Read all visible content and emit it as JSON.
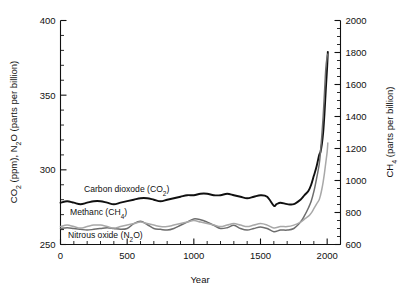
{
  "chart_data": {
    "type": "line",
    "title": "",
    "xlabel": "Year",
    "ylabel_left": "CO2 (ppm), N2O (parts per billion)",
    "ylabel_right": "CH4 (parts per billion)",
    "xlim": [
      0,
      2100
    ],
    "ylim_left": [
      250,
      400
    ],
    "ylim_right": [
      600,
      2000
    ],
    "grid": false,
    "legend_position": "inline-annotations",
    "xticks": [
      0,
      500,
      1000,
      1500,
      2000
    ],
    "xticklabels": [
      "0",
      "500",
      "1000",
      "1500",
      "2000"
    ],
    "x_minor_step": 100,
    "yticks_left": [
      250,
      300,
      350,
      400
    ],
    "yticklabels_left": [
      "250",
      "300",
      "350",
      "400"
    ],
    "y_left_minor_step": 10,
    "yticks_right": [
      600,
      800,
      1000,
      1200,
      1400,
      1600,
      1800,
      2000
    ],
    "yticklabels_right": [
      "600",
      "800",
      "1000",
      "1200",
      "1400",
      "1600",
      "1800",
      "2000"
    ],
    "y_right_minor_step": 50,
    "series": [
      {
        "name": "Carbon dioxode (CO2)",
        "label": "Carbon dioxode (CO₂)",
        "axis": "left",
        "units": "ppm",
        "color": "#101010",
        "stroke_width": 1.9,
        "label_x": 300,
        "label_y": 292,
        "x": [
          0,
          50,
          100,
          150,
          200,
          250,
          300,
          350,
          400,
          450,
          500,
          550,
          600,
          650,
          700,
          750,
          800,
          850,
          900,
          950,
          1000,
          1050,
          1100,
          1150,
          1200,
          1250,
          1300,
          1350,
          1400,
          1450,
          1500,
          1550,
          1600,
          1620,
          1650,
          1700,
          1750,
          1800,
          1830,
          1860,
          1880,
          1900,
          1920,
          1940,
          1950,
          1960,
          1970,
          1980,
          1990,
          2000,
          2005
        ],
        "y": [
          278,
          279,
          278,
          277,
          278,
          279,
          279,
          278,
          277,
          278,
          279,
          280,
          281,
          281,
          280,
          279,
          280,
          281,
          282,
          283,
          283,
          284,
          284,
          283,
          283,
          284,
          283,
          282,
          281,
          282,
          283,
          282,
          276,
          277,
          278,
          277,
          277,
          280,
          283,
          286,
          290,
          296,
          302,
          310,
          312,
          317,
          325,
          338,
          354,
          369,
          379
        ]
      },
      {
        "name": "Methanc (CH4)",
        "label": "Methanc (CH₄)",
        "axis": "right",
        "units": "ppb",
        "color": "#6d6d6d",
        "stroke_width": 1.5,
        "label_x": 240,
        "label_y": 1000,
        "x": [
          0,
          50,
          100,
          150,
          200,
          250,
          300,
          350,
          400,
          450,
          500,
          550,
          600,
          650,
          700,
          750,
          800,
          850,
          900,
          950,
          1000,
          1050,
          1100,
          1150,
          1200,
          1250,
          1300,
          1350,
          1400,
          1450,
          1500,
          1550,
          1600,
          1650,
          1700,
          1750,
          1800,
          1830,
          1860,
          1880,
          1900,
          1920,
          1940,
          1950,
          1960,
          1970,
          1980,
          1990,
          2000,
          2005
        ],
        "y": [
          700,
          705,
          700,
          695,
          690,
          695,
          700,
          705,
          700,
          695,
          700,
          730,
          745,
          725,
          700,
          695,
          690,
          700,
          720,
          740,
          760,
          755,
          740,
          720,
          700,
          705,
          720,
          700,
          690,
          700,
          710,
          700,
          680,
          690,
          690,
          700,
          740,
          780,
          830,
          870,
          930,
          1010,
          1100,
          1180,
          1280,
          1400,
          1550,
          1700,
          1775,
          1790
        ]
      },
      {
        "name": "Nitrous oxide (N2O)",
        "label": "Nitrous oxide (N₂O)",
        "axis": "left",
        "units": "ppb",
        "color": "#a8a8a8",
        "stroke_width": 1.5,
        "label_x": 300,
        "label_y": 258,
        "x": [
          0,
          50,
          100,
          150,
          200,
          250,
          300,
          350,
          400,
          450,
          500,
          550,
          600,
          650,
          700,
          750,
          800,
          850,
          900,
          950,
          1000,
          1050,
          1100,
          1150,
          1200,
          1250,
          1300,
          1350,
          1400,
          1450,
          1500,
          1550,
          1600,
          1650,
          1700,
          1750,
          1800,
          1830,
          1860,
          1880,
          1900,
          1920,
          1940,
          1950,
          1960,
          1970,
          1980,
          1990,
          2000,
          2005
        ],
        "y": [
          262,
          263,
          262,
          261,
          262,
          263,
          263,
          262,
          261,
          262,
          263,
          264,
          265,
          264,
          263,
          262,
          262,
          263,
          264,
          265,
          266,
          265,
          264,
          263,
          262,
          263,
          264,
          263,
          262,
          263,
          264,
          263,
          261,
          262,
          262,
          263,
          265,
          267,
          269,
          271,
          274,
          277,
          280,
          283,
          287,
          292,
          298,
          305,
          312,
          318
        ]
      }
    ],
    "annotations": [
      {
        "text": "Carbon dioxode (CO₂)",
        "series": "co2"
      },
      {
        "text": "Methanc (CH₄)",
        "series": "ch4"
      },
      {
        "text": "Nitrous oxide (N₂O)",
        "series": "n2o"
      }
    ]
  },
  "labels": {
    "x_axis_title": "Year",
    "y_axis_left_parts": {
      "a": "CO",
      "sub1": "2",
      "b": " (ppm), N",
      "sub2": "2",
      "c": "O (parts per billion)"
    },
    "y_axis_right_parts": {
      "a": "CH",
      "sub": "4",
      "b": " (parts per billion)"
    },
    "co2_parts": {
      "a": "Carbon dioxode (CO",
      "sub": "2",
      "b": ")"
    },
    "ch4_parts": {
      "a": "Methanc (CH",
      "sub": "4",
      "b": ")"
    },
    "n2o_parts": {
      "a": "Nitrous oxide (N",
      "sub": "2",
      "b": "O)"
    }
  }
}
